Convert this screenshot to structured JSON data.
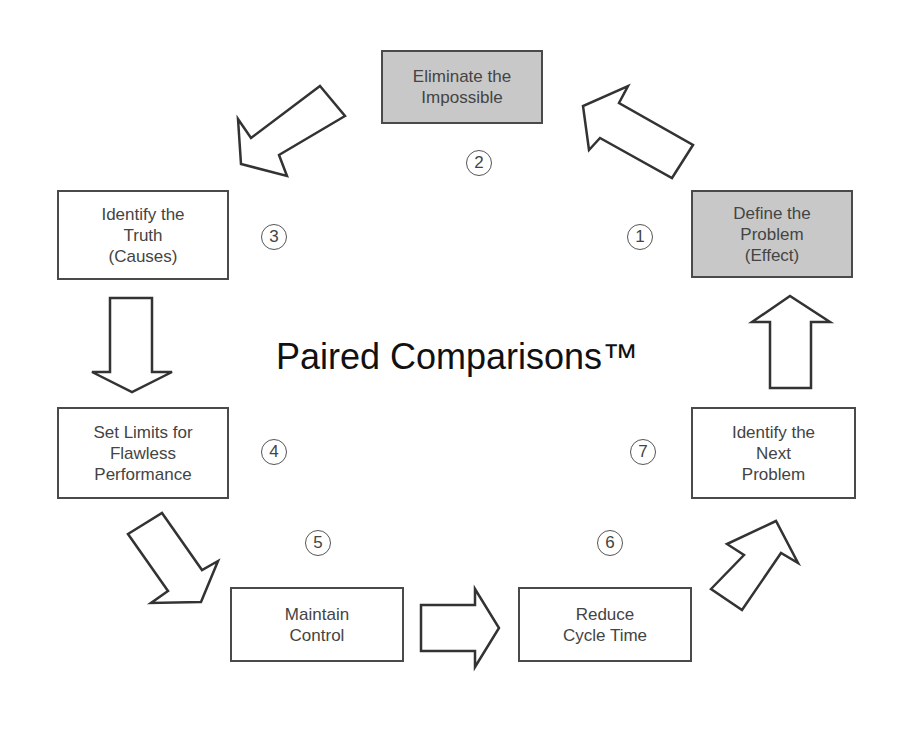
{
  "diagram": {
    "title": "Paired Comparisons™",
    "steps": [
      {
        "number": "1",
        "label": "Define the\nProblem\n(Effect)",
        "shaded": true
      },
      {
        "number": "2",
        "label": "Eliminate the\nImpossible",
        "shaded": true
      },
      {
        "number": "3",
        "label": "Identify the\nTruth\n(Causes)",
        "shaded": false
      },
      {
        "number": "4",
        "label": "Set Limits for\nFlawless\nPerformance",
        "shaded": false
      },
      {
        "number": "5",
        "label": "Maintain\nControl",
        "shaded": false
      },
      {
        "number": "6",
        "label": "Reduce\nCycle Time",
        "shaded": false
      },
      {
        "number": "7",
        "label": "Identify the\nNext\nProblem",
        "shaded": false
      }
    ],
    "colors": {
      "shaded_box": "#c8c8c8",
      "border": "#4a4a4a",
      "background": "#ffffff"
    },
    "flow": "cycle 1 → 2 → 3 → 4 → 5 → 6 → 7 → 1"
  }
}
